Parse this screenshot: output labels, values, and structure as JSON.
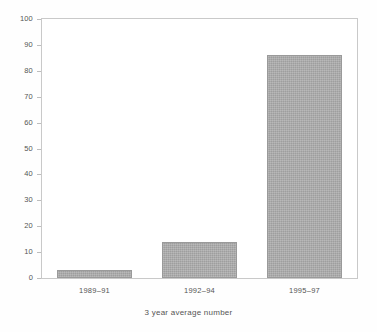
{
  "chart_data": {
    "type": "bar",
    "title": "",
    "subtitle": "",
    "xlabel": "3 year average number",
    "ylabel": "",
    "categories": [
      "1989–91",
      "1992–94",
      "1995–97"
    ],
    "values": [
      3,
      14,
      86
    ],
    "series": [
      {
        "name": "",
        "values": [
          3,
          14,
          86
        ]
      }
    ],
    "ylim": [
      0,
      100
    ],
    "y_ticks": [
      0,
      10,
      20,
      30,
      40,
      50,
      60,
      70,
      80,
      90,
      100
    ],
    "y_tick_labels": [
      "0",
      "10",
      "20",
      "30",
      "40",
      "50",
      "60",
      "70",
      "80",
      "90",
      "100"
    ],
    "grid": false,
    "legend": false,
    "legend_position": "none",
    "annotations": [],
    "colors": {
      "bar_fill": "#a9a9a9",
      "bar_edge": "#9a9a9a",
      "axis": "#c9c9c9",
      "text": "#555555",
      "background": "#ffffff"
    }
  }
}
